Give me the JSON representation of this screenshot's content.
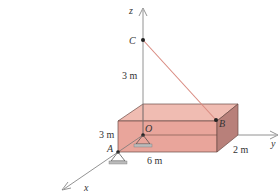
{
  "diagram": {
    "axes": {
      "x": "x",
      "y": "y",
      "z": "z"
    },
    "points": {
      "A": "A",
      "B": "B",
      "C": "C",
      "O": "O"
    },
    "dimensions": {
      "height_C": "3 m",
      "box_height": "3 m",
      "box_length": "6 m",
      "box_depth": "2 m"
    },
    "colors": {
      "box_front": "#e9a59b",
      "box_top": "#f0b8ae",
      "box_side": "#b57c74",
      "cable": "#d98a80",
      "axis": "#888888"
    }
  }
}
